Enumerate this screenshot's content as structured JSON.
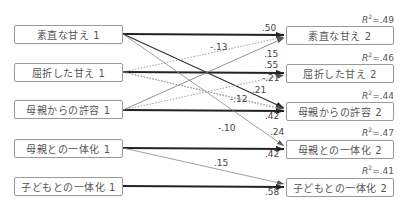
{
  "diagram": {
    "type": "cross-lagged path model",
    "left_nodes": [
      {
        "id": "L1",
        "label": "素直な甘え 1"
      },
      {
        "id": "L2",
        "label": "屈折した甘え 1"
      },
      {
        "id": "L3",
        "label": "母親からの許容 1"
      },
      {
        "id": "L4",
        "label": "母親との一体化 1"
      },
      {
        "id": "L5",
        "label": "子どもとの一体化 1"
      }
    ],
    "right_nodes": [
      {
        "id": "R1",
        "label": "素直な甘え 2",
        "r2_prefix": "R",
        "r2_sup": "2",
        "r2_value": "=.49"
      },
      {
        "id": "R2",
        "label": "屈折した甘え 2",
        "r2_prefix": "R",
        "r2_sup": "2",
        "r2_value": "=.46"
      },
      {
        "id": "R3",
        "label": "母親からの許容 2",
        "r2_prefix": "R",
        "r2_sup": "2",
        "r2_value": "=.44"
      },
      {
        "id": "R4",
        "label": "母親との一体化 2",
        "r2_prefix": "R",
        "r2_sup": "2",
        "r2_value": "=.47"
      },
      {
        "id": "R5",
        "label": "子どもとの一体化 2",
        "r2_prefix": "R",
        "r2_sup": "2",
        "r2_value": "=.41"
      }
    ],
    "paths": [
      {
        "from": "L1",
        "to": "R1",
        "coef": ".50",
        "style": "thick"
      },
      {
        "from": "L2",
        "to": "R1",
        "coef": "-.13",
        "style": "dotted"
      },
      {
        "from": "L3",
        "to": "R1",
        "coef": ".15",
        "style": "thin"
      },
      {
        "from": "L2",
        "to": "R2",
        "coef": ".55",
        "style": "thick"
      },
      {
        "from": "L3",
        "to": "R2",
        "coef": "-.21",
        "style": "dotted"
      },
      {
        "from": "L1",
        "to": "R3",
        "coef": ".21",
        "style": "medium"
      },
      {
        "from": "L2",
        "to": "R3",
        "coef": "-.12",
        "style": "dotted"
      },
      {
        "from": "L3",
        "to": "R3",
        "coef": ".42",
        "style": "thick"
      },
      {
        "from": "L1",
        "to": "R4",
        "coef": ".24",
        "style": "thin"
      },
      {
        "from": "L2",
        "to": "R4",
        "coef": "-.10",
        "style": "dotted"
      },
      {
        "from": "L4",
        "to": "R4",
        "coef": ".42",
        "style": "thick"
      },
      {
        "from": "L4",
        "to": "R5",
        "coef": ".15",
        "style": "thin"
      },
      {
        "from": "L5",
        "to": "R5",
        "coef": ".58",
        "style": "thick"
      }
    ]
  }
}
